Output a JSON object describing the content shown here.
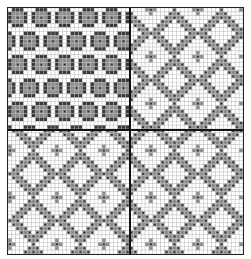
{
  "chart": {
    "type": "knitting-chart",
    "cols": 60,
    "rows": 63,
    "split_col": 31,
    "split_row": 31,
    "colors": {
      "background": "#ffffff",
      "grid_line": "#b8b8b8",
      "fill_gray": "#8c8c8c",
      "dot_dark": "#2b2b2b",
      "outline_dark": "#3a3a3a",
      "divider": "#111111"
    },
    "quadrants": [
      {
        "name": "top-left",
        "motif": "cross",
        "period": 6
      },
      {
        "name": "top-right",
        "motif": "diamond-lattice",
        "period": 12
      },
      {
        "name": "bottom-left",
        "motif": "diamond-lattice",
        "period": 12
      },
      {
        "name": "bottom-right",
        "motif": "diamond-lattice",
        "period": 12
      }
    ]
  }
}
